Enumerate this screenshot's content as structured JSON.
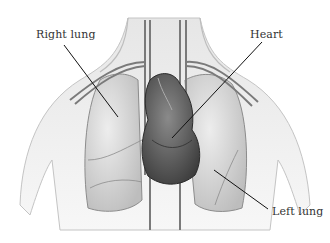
{
  "diagram": {
    "labels": [
      {
        "id": "right-lung",
        "text": "Right lung"
      },
      {
        "id": "heart",
        "text": "Heart"
      },
      {
        "id": "left-lung",
        "text": "Left lung"
      }
    ],
    "colors": {
      "background": "#ffffff",
      "skin": "#dcdcdc",
      "lung": "#cfcfcf",
      "heart": "#5a5a5a",
      "vessel": "#8a8a8a",
      "leader_line": "#111111",
      "label_text": "#333333"
    }
  }
}
